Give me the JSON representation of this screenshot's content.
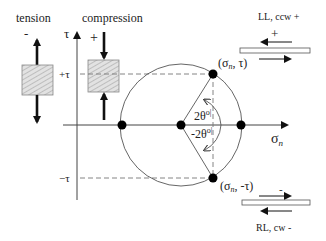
{
  "labels": {
    "tension": "tension",
    "compression": "compression",
    "tension_sign": "-",
    "compression_sign": "+",
    "tau_axis": "τ",
    "sigma_axis": "σ",
    "sigma_sub": "n",
    "plus_tau": "+τ",
    "minus_tau": "−τ",
    "point_upper": "(σ",
    "point_upper_sub": "n",
    "point_upper_tail": ", τ)",
    "point_lower": "(σ",
    "point_lower_sub": "n",
    "point_lower_tail": ", -τ)",
    "angle_pos": "2θ",
    "angle_pos_sup": "o|",
    "angle_neg": "-2θ",
    "angle_neg_sup": "o|",
    "ll_caption": "LL, ccw +",
    "ll_sign": "+",
    "rl_caption": "RL, cw -",
    "rl_sign": "-"
  },
  "colors": {
    "line": "#444444",
    "dash": "#777777",
    "point": "#000000",
    "box_fill": "#d9d9d9"
  }
}
